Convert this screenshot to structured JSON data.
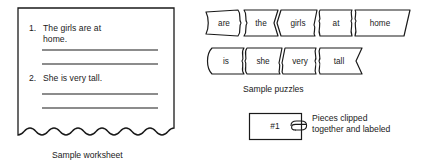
{
  "figure": {
    "background_color": "#ffffff",
    "ink_color": "#1a1a1a"
  },
  "worksheet": {
    "caption": "Sample worksheet",
    "items": [
      {
        "number": "1.",
        "text": "The girls are at\nhome.",
        "blank_lines": 2
      },
      {
        "number": "2.",
        "text": "She is very tall.",
        "blank_lines": 2
      }
    ]
  },
  "puzzles": {
    "caption": "Sample puzzles",
    "rows": [
      {
        "sentence": "The girls are at home.",
        "pieces": [
          "are",
          "the",
          "girls",
          "at",
          "home"
        ]
      },
      {
        "sentence": "She is very tall.",
        "pieces": [
          "is",
          "she",
          "very",
          "tall"
        ]
      }
    ]
  },
  "clipped_label": {
    "box_text": "#1",
    "icon": "paper-clip-icon",
    "note": "Pieces clipped\ntogether and labeled"
  }
}
